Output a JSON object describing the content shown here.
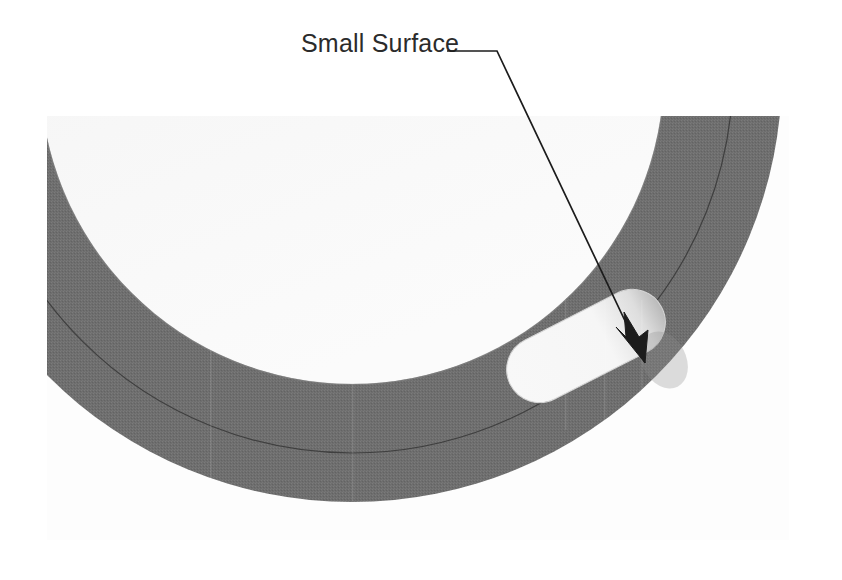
{
  "document": {
    "type": "technical-illustration",
    "background_color": "#ffffff",
    "canvas": {
      "width": 842,
      "height": 580
    }
  },
  "annotation": {
    "label": "Small Surface",
    "label_color": "#2b2b2b",
    "label_position": {
      "x": 301,
      "y": 52
    },
    "leader": {
      "color": "#1c1c1c",
      "stroke_width": 1.7,
      "horizontal_start": {
        "x": 447,
        "y": 51
      },
      "bend": {
        "x": 497,
        "y": 51
      },
      "arrow_tip": {
        "x": 645,
        "y": 363
      }
    },
    "arrowhead": {
      "shape": "solid-barbed",
      "color": "#1c1c1c"
    },
    "points_to": "small-surface-slot"
  },
  "figure": {
    "name": "curved-ring-segment-with-slot",
    "image_plate": {
      "left": 47,
      "top": 116,
      "width": 742,
      "height": 424,
      "tint": "#fbfbfb"
    },
    "ring_band": {
      "name": "annular-wall-band",
      "fill_color": "#6e6e6e",
      "description": "Dark gray annular band sweeping from the left edge around to the upper right",
      "outer_radius": 430,
      "inner_radius": 312,
      "center": {
        "x": 352,
        "y": 72
      }
    },
    "inner_disc": {
      "name": "inner-face",
      "fill_color": "#eeeeee",
      "description": "Light inner region enclosed by the ring"
    },
    "outer_region": {
      "name": "outer-background",
      "fill_color": "#fdfdfd"
    },
    "parting_line": {
      "name": "mid-band-seam-line",
      "color": "#3a3a3a",
      "stroke_width": 1.2,
      "radius": 381,
      "description": "Thin curved seam line running along the middle of the band"
    },
    "slot": {
      "name": "small-surface-slot",
      "fill_color": "#f7f7f7",
      "shape": "obround",
      "center": {
        "x": 586,
        "y": 346
      },
      "length": 170,
      "width": 66,
      "rotation_degrees": -27,
      "description": "Elongated rounded white slot cut into the gray band; the target of the callout"
    },
    "shading": {
      "slot_shadow_color": "#9a9a9a",
      "band_texture": "halftone-dither"
    }
  }
}
